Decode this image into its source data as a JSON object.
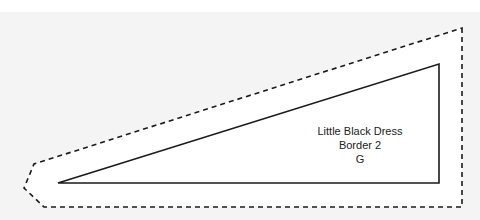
{
  "pattern_piece": {
    "name": "Little Black Dress",
    "piece": "Border 2",
    "grade": "G"
  },
  "colors": {
    "background": "#f4f4f4",
    "paper": "#ffffff",
    "line": "#1a1a1a"
  }
}
